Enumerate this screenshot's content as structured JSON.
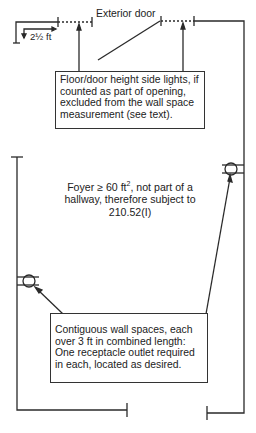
{
  "diagram": {
    "labels": {
      "exterior_door": "Exterior door",
      "dimension": "2½ ft"
    },
    "top_callout": {
      "lines": [
        "Floor/door height side lights, if",
        "counted as part of opening,",
        "excluded from the wall space",
        "measurement (see text)."
      ]
    },
    "center_note": {
      "line1_prefix": "Foyer ≥ 60 ft",
      "line1_sup": "2",
      "line1_suffix": ", not part of a",
      "line2": "hallway, therefore subject to",
      "line3": "210.52(I)"
    },
    "bottom_callout": {
      "lines": [
        "Contiguous wall spaces, each",
        "over 3 ft in combined length:",
        "One receptacle outlet required",
        "in each, located as desired."
      ]
    },
    "symbols": [
      {
        "type": "duplex-receptacle",
        "position": "left-wall"
      },
      {
        "type": "duplex-receptacle",
        "position": "right-wall"
      }
    ],
    "colors": {
      "line": "#2a2a2a",
      "background": "#ffffff"
    }
  }
}
